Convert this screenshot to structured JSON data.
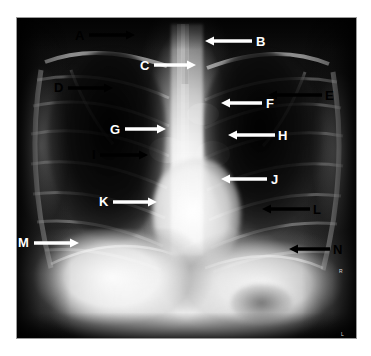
{
  "figure": {
    "modality": "chest-xray",
    "view": "PA",
    "plate": {
      "x": 17,
      "y": 18,
      "width": 339,
      "height": 320
    },
    "canvas": {
      "width": 371,
      "height": 356
    },
    "colors": {
      "page_background": "#ffffff",
      "plate_border": "#9a9a9a",
      "label_light": "#ffffff",
      "label_dark": "#000000",
      "arrow_light": "#ffffff",
      "arrow_dark": "#000000"
    }
  },
  "annotations": [
    {
      "id": "A",
      "label": "A",
      "label_color": "black",
      "arrow_color": "black",
      "label_x": 75,
      "label_y": 29,
      "direction": "right",
      "tail_x": 89,
      "tail_y": 35,
      "tip_x": 135,
      "tip_y": 35
    },
    {
      "id": "B",
      "label": "B",
      "label_color": "white",
      "arrow_color": "white",
      "label_x": 256,
      "label_y": 35,
      "direction": "left",
      "tail_x": 252,
      "tail_y": 41,
      "tip_x": 205,
      "tip_y": 41
    },
    {
      "id": "C",
      "label": "C",
      "label_color": "white",
      "arrow_color": "white",
      "label_x": 140,
      "label_y": 59,
      "direction": "right",
      "tail_x": 154,
      "tail_y": 65,
      "tip_x": 196,
      "tip_y": 65
    },
    {
      "id": "D",
      "label": "D",
      "label_color": "black",
      "arrow_color": "black",
      "label_x": 54,
      "label_y": 81,
      "direction": "right",
      "tail_x": 68,
      "tail_y": 88,
      "tip_x": 113,
      "tip_y": 88
    },
    {
      "id": "E",
      "label": "E",
      "label_color": "black",
      "arrow_color": "black",
      "label_x": 325,
      "label_y": 89,
      "direction": "left",
      "tail_x": 322,
      "tail_y": 95,
      "tip_x": 268,
      "tip_y": 95
    },
    {
      "id": "F",
      "label": "F",
      "label_color": "white",
      "arrow_color": "white",
      "label_x": 266,
      "label_y": 97,
      "direction": "left",
      "tail_x": 262,
      "tail_y": 103,
      "tip_x": 221,
      "tip_y": 103
    },
    {
      "id": "G",
      "label": "G",
      "label_color": "white",
      "arrow_color": "white",
      "label_x": 110,
      "label_y": 123,
      "direction": "right",
      "tail_x": 125,
      "tail_y": 129,
      "tip_x": 166,
      "tip_y": 129
    },
    {
      "id": "H",
      "label": "H",
      "label_color": "white",
      "arrow_color": "white",
      "label_x": 278,
      "label_y": 129,
      "direction": "left",
      "tail_x": 275,
      "tail_y": 135,
      "tip_x": 228,
      "tip_y": 135
    },
    {
      "id": "I",
      "label": "I",
      "label_color": "black",
      "arrow_color": "black",
      "label_x": 92,
      "label_y": 148,
      "direction": "right",
      "tail_x": 100,
      "tail_y": 155,
      "tip_x": 148,
      "tip_y": 155
    },
    {
      "id": "J",
      "label": "J",
      "label_color": "white",
      "arrow_color": "white",
      "label_x": 271,
      "label_y": 173,
      "direction": "left",
      "tail_x": 267,
      "tail_y": 179,
      "tip_x": 221,
      "tip_y": 179
    },
    {
      "id": "K",
      "label": "K",
      "label_color": "white",
      "arrow_color": "white",
      "label_x": 99,
      "label_y": 195,
      "direction": "right",
      "tail_x": 113,
      "tail_y": 202,
      "tip_x": 157,
      "tip_y": 202
    },
    {
      "id": "L",
      "label": "L",
      "label_color": "black",
      "arrow_color": "black",
      "label_x": 313,
      "label_y": 203,
      "direction": "left",
      "tail_x": 310,
      "tail_y": 209,
      "tip_x": 262,
      "tip_y": 209
    },
    {
      "id": "M",
      "label": "M",
      "label_color": "white",
      "arrow_color": "white",
      "label_x": 18,
      "label_y": 236,
      "direction": "right",
      "tail_x": 34,
      "tail_y": 243,
      "tip_x": 79,
      "tip_y": 243
    },
    {
      "id": "N",
      "label": "N",
      "label_color": "black",
      "arrow_color": "black",
      "label_x": 333,
      "label_y": 243,
      "direction": "left",
      "tail_x": 330,
      "tail_y": 249,
      "tip_x": 289,
      "tip_y": 249
    }
  ],
  "corner_marks": [
    {
      "text": "R",
      "x": 339,
      "y": 268
    },
    {
      "text": "L",
      "x": 341,
      "y": 331
    }
  ]
}
